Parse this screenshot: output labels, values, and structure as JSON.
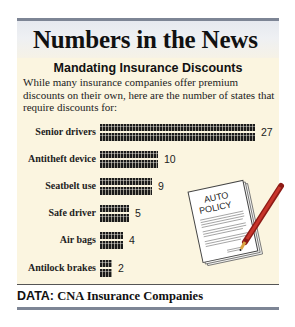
{
  "header": {
    "title": "Numbers in the News"
  },
  "graphic": {
    "subtitle": "Mandating Insurance Discounts",
    "intro": "While many insurance companies offer premium discounts on their own, here are the number of states that require discounts for:",
    "illustration": {
      "icon": "auto-policy-document-with-pen-icon",
      "line1": "AUTO",
      "line2": "POLICY"
    }
  },
  "footer": {
    "label": "DATA:",
    "source": "CNA Insurance Companies"
  },
  "colors": {
    "panel": "#fbf5e0",
    "header_rule": "#7d8595",
    "bar": "#1a1a1a",
    "pen": "#b3261e"
  },
  "chart_data": {
    "type": "bar",
    "orientation": "horizontal",
    "title": "Mandating Insurance Discounts",
    "subtitle": "While many insurance companies offer premium discounts on their own, here are the number of states that require discounts for:",
    "categories": [
      "Senior drivers",
      "Antitheft device",
      "Seatbelt use",
      "Safe driver",
      "Air bags",
      "Antilock brakes"
    ],
    "values": [
      27,
      10,
      9,
      5,
      4,
      2
    ],
    "xlabel": "",
    "ylabel": "",
    "unit": "states",
    "data_labels": true,
    "grid": false,
    "legend": null,
    "source": "DATA: CNA Insurance Companies"
  }
}
